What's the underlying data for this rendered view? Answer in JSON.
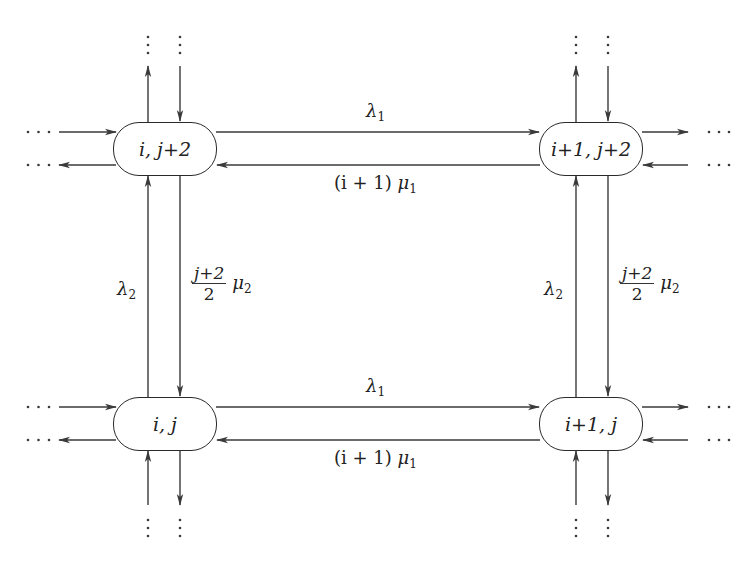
{
  "diagram": {
    "type": "state-transition-lattice",
    "nodes": [
      {
        "id": "n_top_left",
        "label": "i, j+2"
      },
      {
        "id": "n_top_right",
        "label": "i+1, j+2"
      },
      {
        "id": "n_bottom_left",
        "label": "i, j"
      },
      {
        "id": "n_bottom_right",
        "label": "i+1, j"
      }
    ],
    "edges": [
      {
        "from": "i, j+2",
        "to": "i+1, j+2",
        "label": "λ1"
      },
      {
        "from": "i+1, j+2",
        "to": "i, j+2",
        "label": "(i + 1) μ1"
      },
      {
        "from": "i, j",
        "to": "i+1, j",
        "label": "λ1"
      },
      {
        "from": "i+1, j",
        "to": "i, j",
        "label": "(i + 1) μ1"
      },
      {
        "from": "i, j",
        "to": "i, j+2",
        "label": "λ2"
      },
      {
        "from": "i, j+2",
        "to": "i, j",
        "label": "(j+2)/2 μ2"
      },
      {
        "from": "i+1, j",
        "to": "i+1, j+2",
        "label": "λ2"
      },
      {
        "from": "i+1, j+2",
        "to": "i+1, j",
        "label": "(j+2)/2 μ2"
      }
    ],
    "labels": {
      "lambda1": {
        "sym": "λ",
        "sub": "1"
      },
      "lambda2": {
        "sym": "λ",
        "sub": "2"
      },
      "mu1_rate": {
        "prefix": "(i + 1) ",
        "sym": "μ",
        "sub": "1"
      },
      "mu2_num": "j+2",
      "mu2_den": "2",
      "mu2": {
        "sym": "μ",
        "sub": "2"
      }
    },
    "continuation": {
      "horizontal": "· · ·",
      "vertical": "⋮"
    },
    "colors": {
      "line": "#3a3a3a",
      "text": "#222222",
      "background": "#ffffff"
    }
  }
}
